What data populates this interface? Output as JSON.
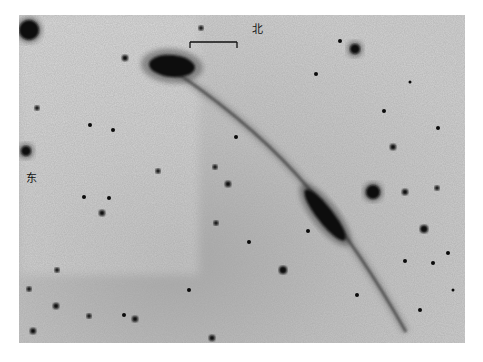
{
  "image": {
    "type": "inverted astronomical photograph",
    "background": "#c8c8c8",
    "bounds": {
      "x": 19,
      "y": 15,
      "width": 446,
      "height": 328
    }
  },
  "labels": {
    "north": {
      "text": "北",
      "x": 252,
      "y": 24
    },
    "east": {
      "text": "东",
      "x": 26,
      "y": 173
    }
  },
  "scale_bar": {
    "x1": 190,
    "y1": 42,
    "x2": 237,
    "y2": 42
  },
  "objects": {
    "galaxy": {
      "cx": 172,
      "cy": 66,
      "rx": 23,
      "ry": 11,
      "rotate": 5
    },
    "nucleus": {
      "cx": 325,
      "cy": 215,
      "rx": 32,
      "ry": 8,
      "rotate": 52
    },
    "tail_path": "M 180 75 Q 260 130 310 190 Q 360 250 406 332"
  },
  "stars": [
    {
      "x": 29,
      "y": 30,
      "r": 10
    },
    {
      "x": 355,
      "y": 49,
      "r": 5
    },
    {
      "x": 125,
      "y": 58,
      "r": 3
    },
    {
      "x": 26,
      "y": 151,
      "r": 5
    },
    {
      "x": 37,
      "y": 108,
      "r": 2.5
    },
    {
      "x": 373,
      "y": 192,
      "r": 7
    },
    {
      "x": 424,
      "y": 229,
      "r": 4
    },
    {
      "x": 405,
      "y": 192,
      "r": 3
    },
    {
      "x": 437,
      "y": 188,
      "r": 2.5
    },
    {
      "x": 393,
      "y": 147,
      "r": 3
    },
    {
      "x": 384,
      "y": 111,
      "r": 2
    },
    {
      "x": 438,
      "y": 128,
      "r": 2
    },
    {
      "x": 283,
      "y": 270,
      "r": 4
    },
    {
      "x": 228,
      "y": 184,
      "r": 3
    },
    {
      "x": 215,
      "y": 167,
      "r": 2.5
    },
    {
      "x": 158,
      "y": 171,
      "r": 2.5
    },
    {
      "x": 90,
      "y": 125,
      "r": 2
    },
    {
      "x": 113,
      "y": 130,
      "r": 2
    },
    {
      "x": 109,
      "y": 198,
      "r": 2
    },
    {
      "x": 84,
      "y": 197,
      "r": 2
    },
    {
      "x": 102,
      "y": 213,
      "r": 3
    },
    {
      "x": 135,
      "y": 319,
      "r": 3
    },
    {
      "x": 89,
      "y": 316,
      "r": 2.5
    },
    {
      "x": 57,
      "y": 270,
      "r": 2.5
    },
    {
      "x": 29,
      "y": 289,
      "r": 2.5
    },
    {
      "x": 56,
      "y": 306,
      "r": 3
    },
    {
      "x": 124,
      "y": 315,
      "r": 2
    },
    {
      "x": 33,
      "y": 331,
      "r": 3
    },
    {
      "x": 212,
      "y": 338,
      "r": 3
    },
    {
      "x": 216,
      "y": 223,
      "r": 2.5
    },
    {
      "x": 249,
      "y": 242,
      "r": 2
    },
    {
      "x": 189,
      "y": 290,
      "r": 2
    },
    {
      "x": 308,
      "y": 231,
      "r": 2
    },
    {
      "x": 236,
      "y": 137,
      "r": 2
    },
    {
      "x": 201,
      "y": 28,
      "r": 2.5
    },
    {
      "x": 340,
      "y": 41,
      "r": 2
    },
    {
      "x": 433,
      "y": 263,
      "r": 2
    },
    {
      "x": 448,
      "y": 253,
      "r": 2
    },
    {
      "x": 357,
      "y": 295,
      "r": 2
    },
    {
      "x": 405,
      "y": 261,
      "r": 2
    },
    {
      "x": 410,
      "y": 82,
      "r": 1.5
    },
    {
      "x": 316,
      "y": 74,
      "r": 2
    },
    {
      "x": 420,
      "y": 310,
      "r": 2
    },
    {
      "x": 453,
      "y": 290,
      "r": 1.5
    }
  ]
}
